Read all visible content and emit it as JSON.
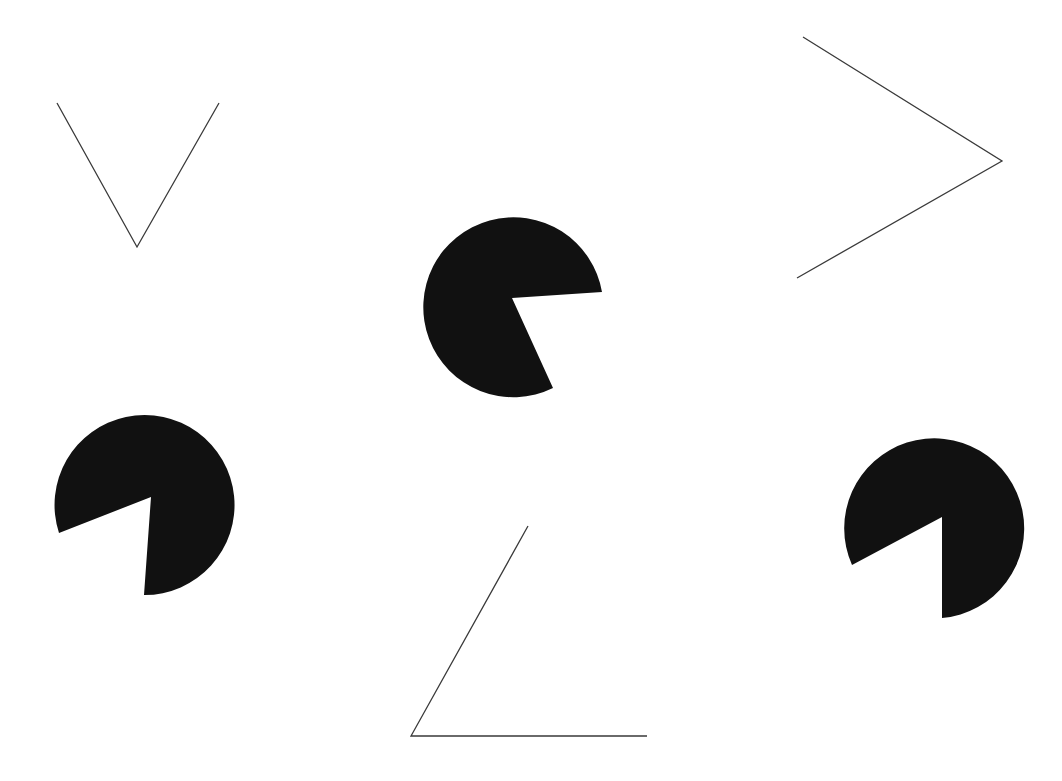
{
  "figure": {
    "background": "#ffffff",
    "fill_color": "#111111",
    "stroke_color": "#3a3a3a",
    "pacmen": [
      {
        "id": "pacman-top-center",
        "cx": 515,
        "cy": 302,
        "r": 90,
        "vertex": [
          512,
          298
        ],
        "edge_a": [
          602,
          292
        ],
        "edge_b": [
          553,
          388
        ]
      },
      {
        "id": "pacman-left",
        "cx": 143,
        "cy": 505,
        "r": 90,
        "vertex": [
          151,
          497
        ],
        "edge_a": [
          59,
          533
        ],
        "edge_b": [
          144,
          595
        ]
      },
      {
        "id": "pacman-right",
        "cx": 934,
        "cy": 528,
        "r": 90,
        "vertex": [
          942,
          517
        ],
        "edge_a": [
          852,
          565
        ],
        "edge_b": [
          942,
          618
        ]
      }
    ],
    "angles": [
      {
        "id": "angle-v-top-left",
        "points": [
          [
            57,
            103
          ],
          [
            137,
            247
          ],
          [
            219,
            103
          ]
        ]
      },
      {
        "id": "angle-chevron-top-right",
        "points": [
          [
            803,
            37
          ],
          [
            1002,
            161
          ],
          [
            797,
            278
          ]
        ]
      },
      {
        "id": "angle-bottom",
        "points": [
          [
            528,
            526
          ],
          [
            411,
            736
          ],
          [
            647,
            736
          ]
        ]
      }
    ]
  }
}
